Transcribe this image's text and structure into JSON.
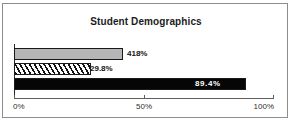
{
  "chart_data": {
    "type": "bar",
    "orientation": "horizontal",
    "title": "Student Demographics",
    "xlabel": "",
    "ylabel": "",
    "categories": [
      "series-1",
      "series-2",
      "series-3"
    ],
    "values": [
      41.8,
      29.8,
      89.4
    ],
    "data_labels": [
      "418%",
      "29.8%",
      "89.4%"
    ],
    "xlim": [
      0,
      100
    ],
    "xticks": [
      0,
      50,
      100
    ],
    "xtick_labels": [
      "0%",
      "50%",
      "100%"
    ],
    "grid": false,
    "legend": "none",
    "bar_styles": [
      "solid-gray",
      "diagonal-hatch",
      "solid-black"
    ],
    "colors": {
      "bar1": "#b6b6b6",
      "bar2": "#ffffff",
      "bar3": "#060606",
      "outline": "#1a1a1a",
      "axis": "#5e5e5e",
      "text": "#141414",
      "label_on_dark": "#ffffff",
      "frame": "#8d8d8d",
      "background": "#ffffff"
    },
    "label_placement": [
      "outside-end",
      "outside-end",
      "inside-end"
    ]
  }
}
